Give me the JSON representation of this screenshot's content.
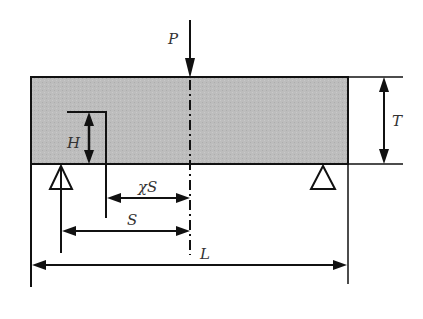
{
  "diagram": {
    "type": "three-point bending beam with notch",
    "labels": {
      "load": "P",
      "notch_height": "H",
      "thickness": "T",
      "notch_offset": "χS",
      "half_span": "S",
      "length": "L"
    },
    "colors": {
      "beam_fill": "#bdbdbd",
      "line": "#111111",
      "background": "#ffffff"
    }
  }
}
